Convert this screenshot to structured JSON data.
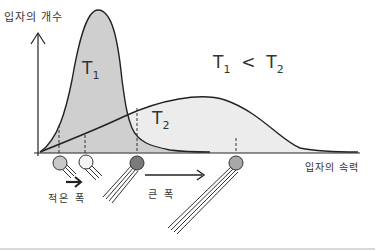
{
  "diagram": {
    "y_axis_label": "입자의 개수",
    "x_axis_label": "입자의 속력",
    "curves": [
      {
        "name": "T1",
        "label_main": "T",
        "label_sub": "1",
        "shape": "tall narrow peak",
        "fill": "#cfcfcf"
      },
      {
        "name": "T2",
        "label_main": "T",
        "label_sub": "2",
        "shape": "low broad peak",
        "fill": "#ececec"
      }
    ],
    "relation": {
      "left_main": "T",
      "left_sub": "1",
      "op": "<",
      "right_main": "T",
      "right_sub": "2"
    },
    "annotations": {
      "small_width": "적은 폭",
      "large_width": "큰 폭"
    },
    "colors": {
      "line": "#222222",
      "t1_fill": "#cfcfcf",
      "t2_fill": "#ececec",
      "ball_light": "#c8c8c8",
      "ball_white": "#f4f4f4",
      "ball_dark": "#7a7a7a",
      "ball_mid": "#a8a8a8"
    }
  }
}
